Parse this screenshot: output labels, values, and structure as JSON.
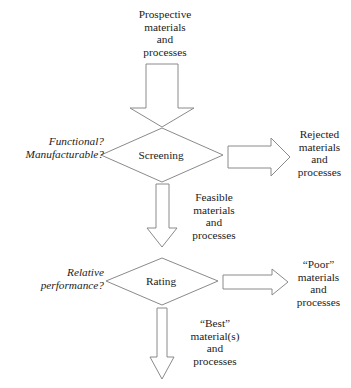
{
  "diagram": {
    "line_color": "#8a8a8a",
    "text_color": "#1c1c1c",
    "background": "#ffffff"
  },
  "nodes": {
    "input": {
      "label": "Prospective\nmaterials\nand\nprocesses"
    },
    "screening": {
      "label": "Screening",
      "criteria": "Functional?\nManufacturable?",
      "reject_output": "Rejected\nmaterials\nand\nprocesses",
      "pass_output": "Feasible\nmaterials\nand\nprocesses"
    },
    "rating": {
      "label": "Rating",
      "criteria": "Relative\nperformance?",
      "reject_output": "“Poor”\nmaterials\nand\nprocesses",
      "pass_output": "“Best”\nmaterial(s)\nand\nprocesses"
    }
  },
  "shapes": {
    "arrow_big_down": "block-arrow-down",
    "arrow_screening_down": "block-arrow-down-narrow",
    "arrow_screening_right": "block-arrow-right",
    "arrow_rating_right": "block-arrow-right-thin",
    "arrow_rating_down": "block-arrow-down-long",
    "decision_screening": "diamond",
    "decision_rating": "diamond"
  }
}
